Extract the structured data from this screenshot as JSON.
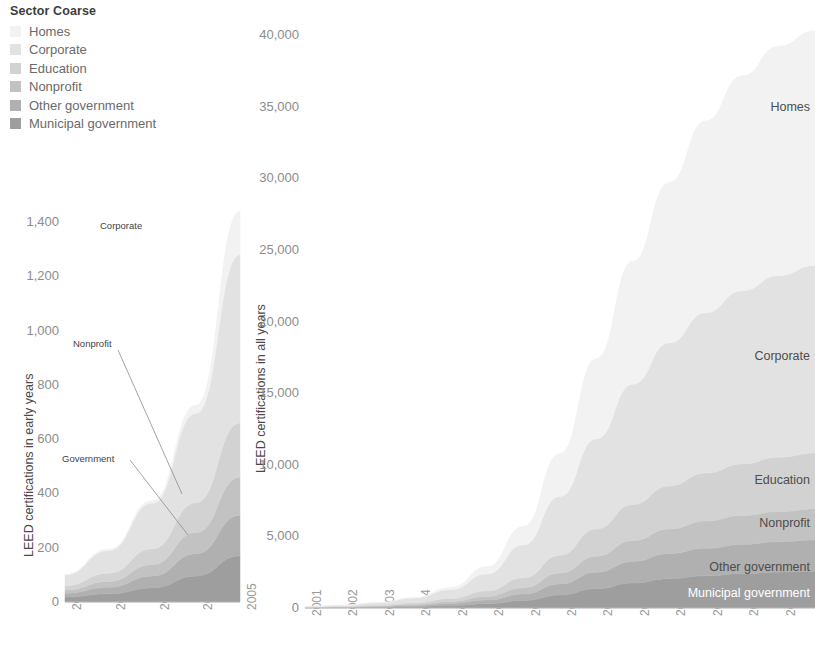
{
  "legend": {
    "title": "Sector Coarse",
    "items": [
      {
        "label": "Homes",
        "color": "#f2f2f2"
      },
      {
        "label": "Corporate",
        "color": "#e2e2e2"
      },
      {
        "label": "Education",
        "color": "#d2d2d2"
      },
      {
        "label": "Nonprofit",
        "color": "#c2c2c2"
      },
      {
        "label": "Other government",
        "color": "#b0b0b0"
      },
      {
        "label": "Municipal government",
        "color": "#9e9e9e"
      }
    ]
  },
  "chart_data": [
    {
      "id": "early",
      "type": "area",
      "title": "",
      "xlabel": "",
      "ylabel": "LEED certifications in early years",
      "x": [
        2001,
        2002,
        2003,
        2004,
        2005
      ],
      "categories": [
        "2001",
        "2002",
        "2003",
        "2004",
        "2005"
      ],
      "ylim": [
        0,
        1500
      ],
      "yticks": [
        0,
        200,
        400,
        600,
        800,
        1000,
        1200,
        1400
      ],
      "ytick_labels": [
        "0",
        "200",
        "400",
        "600",
        "800",
        "1,000",
        "1,200",
        "1,400"
      ],
      "grid": false,
      "stacked": true,
      "legend_position": "none",
      "series": [
        {
          "name": "Municipal government",
          "color": "#9e9e9e",
          "values": [
            18,
            30,
            52,
            96,
            170
          ]
        },
        {
          "name": "Other government",
          "color": "#b0b0b0",
          "values": [
            14,
            24,
            44,
            82,
            150
          ]
        },
        {
          "name": "Nonprofit",
          "color": "#c2c2c2",
          "values": [
            12,
            22,
            42,
            78,
            140
          ]
        },
        {
          "name": "Education",
          "color": "#d2d2d2",
          "values": [
            16,
            30,
            58,
            110,
            200
          ]
        },
        {
          "name": "Corporate",
          "color": "#e2e2e2",
          "values": [
            40,
            84,
            168,
            330,
            620
          ]
        },
        {
          "name": "Homes",
          "color": "#f2f2f2",
          "values": [
            2,
            5,
            10,
            30,
            160
          ]
        }
      ],
      "annotations": [
        {
          "text": "Corporate",
          "leader": false
        },
        {
          "text": "Nonprofit",
          "leader": true
        },
        {
          "text": "Government",
          "leader": true
        }
      ]
    },
    {
      "id": "all",
      "type": "area",
      "title": "",
      "xlabel": "",
      "ylabel": "LEED certifications in all years",
      "x": [
        2001,
        2002,
        2003,
        2004,
        2005,
        2006,
        2007,
        2008,
        2009,
        2010,
        2011,
        2012,
        2013,
        2014,
        2015
      ],
      "categories": [
        "2001",
        "2002",
        "2003",
        "2004",
        "2005",
        "2006",
        "2007",
        "2008",
        "2009",
        "2010",
        "2011",
        "2012",
        "2013",
        "2014",
        "2015"
      ],
      "ylim": [
        0,
        40500
      ],
      "yticks": [
        0,
        5000,
        10000,
        15000,
        20000,
        25000,
        30000,
        35000,
        40000
      ],
      "ytick_labels": [
        "0",
        "5,000",
        "10,000",
        "15,000",
        "20,000",
        "25,000",
        "30,000",
        "35,000",
        "40,000"
      ],
      "grid": false,
      "stacked": true,
      "legend_position": "inline-right",
      "series": [
        {
          "name": "Municipal government",
          "color": "#9e9e9e",
          "values": [
            18,
            30,
            52,
            96,
            170,
            300,
            520,
            900,
            1350,
            1750,
            2050,
            2250,
            2400,
            2500,
            2560
          ]
        },
        {
          "name": "Other government",
          "color": "#b0b0b0",
          "values": [
            14,
            24,
            44,
            82,
            150,
            260,
            450,
            780,
            1150,
            1500,
            1750,
            1920,
            2040,
            2130,
            2190
          ]
        },
        {
          "name": "Nonprofit",
          "color": "#c2c2c2",
          "values": [
            12,
            22,
            42,
            78,
            140,
            250,
            440,
            760,
            1120,
            1460,
            1720,
            1900,
            2020,
            2110,
            2170
          ]
        },
        {
          "name": "Education",
          "color": "#d2d2d2",
          "values": [
            16,
            30,
            58,
            110,
            200,
            380,
            700,
            1250,
            1900,
            2520,
            3000,
            3350,
            3600,
            3780,
            3900
          ]
        },
        {
          "name": "Corporate",
          "color": "#e2e2e2",
          "values": [
            40,
            84,
            168,
            330,
            620,
            1200,
            2300,
            4100,
            6300,
            8400,
            10000,
            11200,
            12100,
            12700,
            13100
          ]
        },
        {
          "name": "Homes",
          "color": "#f2f2f2",
          "values": [
            2,
            5,
            10,
            30,
            160,
            500,
            1300,
            3000,
            5600,
            8600,
            11200,
            13400,
            15000,
            16000,
            16400
          ]
        }
      ],
      "series_labels": [
        "Homes",
        "Corporate",
        "Education",
        "Nonprofit",
        "Other government",
        "Municipal government"
      ]
    }
  ]
}
